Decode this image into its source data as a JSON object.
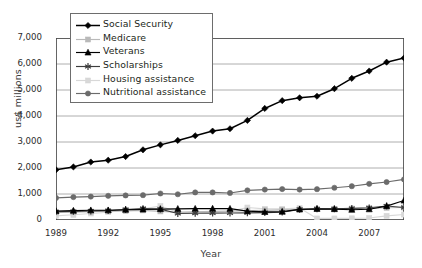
{
  "chart_data": {
    "type": "line",
    "title": "",
    "xlabel": "Year",
    "ylabel": "us$ millions",
    "xlim": [
      1989,
      2009
    ],
    "ylim": [
      0,
      7000
    ],
    "grid": true,
    "legend_position": "top-left",
    "x": [
      1989,
      1990,
      1991,
      1992,
      1993,
      1994,
      1995,
      1996,
      1997,
      1998,
      1999,
      2000,
      2001,
      2002,
      2003,
      2004,
      2005,
      2006,
      2007,
      2008,
      2009
    ],
    "xtick_labels": [
      "1989",
      "1992",
      "1995",
      "1998",
      "2001",
      "2004",
      "2007"
    ],
    "xtick_values": [
      1989,
      1992,
      1995,
      1998,
      2001,
      2004,
      2007
    ],
    "ytick_labels": [
      "0",
      "1,000",
      "2,000",
      "3,000",
      "4,000",
      "5,000",
      "6,000",
      "7,000"
    ],
    "ytick_values": [
      0,
      1000,
      2000,
      3000,
      4000,
      5000,
      6000,
      7000
    ],
    "series": [
      {
        "name": "Social Security",
        "marker": "diamond",
        "color": "#000000",
        "values": [
          1930,
          2040,
          2230,
          2300,
          2440,
          2700,
          2890,
          3060,
          3240,
          3420,
          3510,
          3830,
          4290,
          4590,
          4700,
          4760,
          5050,
          5450,
          5730,
          6070,
          6230
        ]
      },
      {
        "name": "Medicare",
        "marker": "square",
        "color": "#b9b9b9",
        "values": [
          290,
          300,
          320,
          340,
          350,
          370,
          330,
          300,
          310,
          330,
          340,
          360,
          370,
          390,
          400,
          420,
          430,
          440,
          450,
          470,
          480
        ]
      },
      {
        "name": "Veterans",
        "marker": "triangle",
        "color": "#000000",
        "values": [
          345,
          360,
          375,
          375,
          395,
          405,
          420,
          430,
          435,
          440,
          435,
          340,
          310,
          320,
          410,
          430,
          420,
          395,
          415,
          535,
          750
        ]
      },
      {
        "name": "Scholarships",
        "marker": "star-x",
        "color": "#3d3d3d",
        "values": [
          320,
          330,
          345,
          360,
          400,
          440,
          420,
          250,
          260,
          265,
          270,
          275,
          285,
          300,
          410,
          425,
          430,
          445,
          470,
          540,
          480
        ]
      },
      {
        "name": "Housing assistance",
        "marker": "square",
        "color": "#d8d8d8",
        "values": [
          160,
          200,
          250,
          300,
          390,
          430,
          540,
          300,
          310,
          320,
          330,
          480,
          430,
          430,
          460,
          60,
          60,
          65,
          75,
          160,
          210
        ]
      },
      {
        "name": "Nutritional assistance",
        "marker": "circle",
        "color": "#6b6b6b",
        "values": [
          850,
          880,
          900,
          930,
          945,
          955,
          1020,
          990,
          1060,
          1060,
          1040,
          1140,
          1170,
          1190,
          1170,
          1185,
          1240,
          1300,
          1390,
          1460,
          1560
        ]
      }
    ]
  },
  "legend": {
    "items": [
      {
        "label": "Social Security"
      },
      {
        "label": "Medicare"
      },
      {
        "label": "Veterans"
      },
      {
        "label": "Scholarships"
      },
      {
        "label": "Housing assistance"
      },
      {
        "label": "Nutritional assistance"
      }
    ]
  }
}
